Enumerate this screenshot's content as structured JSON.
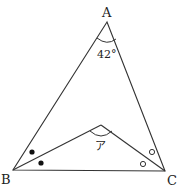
{
  "diagram": {
    "type": "geometry-triangle",
    "vertices": {
      "A": {
        "label": "A",
        "x": 107,
        "y": 22
      },
      "B": {
        "label": "B",
        "x": 13,
        "y": 170
      },
      "C": {
        "label": "C",
        "x": 165,
        "y": 171
      },
      "P": {
        "label": "",
        "x": 101,
        "y": 125
      }
    },
    "angle_A": {
      "label": "42°"
    },
    "angle_P": {
      "label": "ア"
    },
    "bisector_marks": {
      "B": "filled-dot",
      "C": "hollow-circle"
    },
    "colors": {
      "stroke": "#333333",
      "text": "#222222"
    }
  }
}
